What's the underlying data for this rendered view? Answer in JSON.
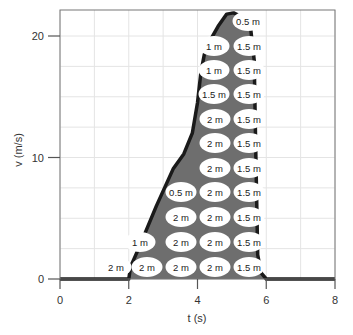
{
  "chart_data": {
    "type": "area",
    "title": "",
    "xlabel": "t (s)",
    "ylabel": "v (m/s)",
    "xlim": [
      0,
      8
    ],
    "ylim": [
      0,
      22
    ],
    "x_ticks": [
      0,
      2,
      4,
      6,
      8
    ],
    "y_ticks": [
      0,
      10,
      20
    ],
    "grid": true,
    "grid_x_step": 1,
    "grid_y_step": 2.5,
    "series": [
      {
        "name": "velocity",
        "x": [
          0,
          2.0,
          2.05,
          2.3,
          2.8,
          3.3,
          3.6,
          3.85,
          4.0,
          4.1,
          4.2,
          4.4,
          4.6,
          4.85,
          5.05,
          5.35,
          5.55,
          5.65,
          5.7,
          5.75,
          5.85,
          6.0,
          8
        ],
        "values": [
          0,
          0,
          1.0,
          2.6,
          6.0,
          9.1,
          10.3,
          12.0,
          14.5,
          17.0,
          18.5,
          19.8,
          20.8,
          21.8,
          21.9,
          21.5,
          20.5,
          18.0,
          10.0,
          2.0,
          0.5,
          0,
          0
        ]
      }
    ],
    "area_color": "#6e6e6e",
    "outline_color": "#1a1a1a",
    "annotations": {
      "description": "Area under the curve divided into cells, each labeled with its displacement",
      "rows": [
        {
          "v_center": 1,
          "labels": [
            "2 m",
            "2 m",
            "2 m",
            "1.5 m"
          ]
        },
        {
          "v_center": 3,
          "labels": [
            "1 m",
            "2 m",
            "2 m",
            "1.5 m"
          ]
        },
        {
          "v_center": 5,
          "labels": [
            "2 m",
            "2 m",
            "1.5 m"
          ]
        },
        {
          "v_center": 7,
          "labels": [
            "0.5 m",
            "2 m",
            "1.5 m"
          ]
        },
        {
          "v_center": 9,
          "labels": [
            "2 m",
            "1.5 m"
          ]
        },
        {
          "v_center": 11,
          "labels": [
            "2 m",
            "1.5 m"
          ]
        },
        {
          "v_center": 13,
          "labels": [
            "2 m",
            "1.5 m"
          ]
        },
        {
          "v_center": 15,
          "labels": [
            "1.5 m",
            "1.5 m"
          ]
        },
        {
          "v_center": 17,
          "labels": [
            "1 m",
            "1.5 m"
          ]
        },
        {
          "v_center": 19,
          "labels": [
            "1 m",
            "1.5 m"
          ]
        },
        {
          "v_center": 21,
          "labels": [
            "0.5 m"
          ]
        }
      ]
    }
  },
  "axes": {
    "x_label": "t (s)",
    "y_label": "v (m/s)",
    "x_tick_labels": [
      "0",
      "2",
      "4",
      "6",
      "8"
    ],
    "y_tick_labels": [
      "0",
      "10",
      "20"
    ]
  },
  "cells": [
    {
      "x": 116,
      "y": 267,
      "text": "2 m"
    },
    {
      "x": 147,
      "y": 267,
      "text": "2 m"
    },
    {
      "x": 181,
      "y": 267,
      "text": "2 m"
    },
    {
      "x": 215,
      "y": 267,
      "text": "2 m"
    },
    {
      "x": 249,
      "y": 267,
      "text": "1.5 m"
    },
    {
      "x": 140,
      "y": 242,
      "text": "1 m"
    },
    {
      "x": 181,
      "y": 242,
      "text": "2 m"
    },
    {
      "x": 215,
      "y": 242,
      "text": "2 m"
    },
    {
      "x": 249,
      "y": 242,
      "text": "1.5 m"
    },
    {
      "x": 181,
      "y": 217,
      "text": "2 m"
    },
    {
      "x": 215,
      "y": 217,
      "text": "2 m"
    },
    {
      "x": 249,
      "y": 217,
      "text": "1.5 m"
    },
    {
      "x": 181,
      "y": 192,
      "text": "0.5 m"
    },
    {
      "x": 215,
      "y": 192,
      "text": "2 m"
    },
    {
      "x": 249,
      "y": 192,
      "text": "1.5 m"
    },
    {
      "x": 215,
      "y": 168,
      "text": "2 m"
    },
    {
      "x": 249,
      "y": 168,
      "text": "1.5 m"
    },
    {
      "x": 215,
      "y": 143,
      "text": "2 m"
    },
    {
      "x": 249,
      "y": 143,
      "text": "1.5 m"
    },
    {
      "x": 215,
      "y": 119,
      "text": "2 m"
    },
    {
      "x": 249,
      "y": 119,
      "text": "1.5 m"
    },
    {
      "x": 214,
      "y": 94,
      "text": "1.5 m"
    },
    {
      "x": 249,
      "y": 94,
      "text": "1.5 m"
    },
    {
      "x": 214,
      "y": 70,
      "text": "1 m"
    },
    {
      "x": 249,
      "y": 70,
      "text": "1.5 m"
    },
    {
      "x": 214,
      "y": 46,
      "text": "1 m"
    },
    {
      "x": 249,
      "y": 46,
      "text": "1.5 m"
    },
    {
      "x": 248,
      "y": 21,
      "text": "0.5 m"
    }
  ]
}
